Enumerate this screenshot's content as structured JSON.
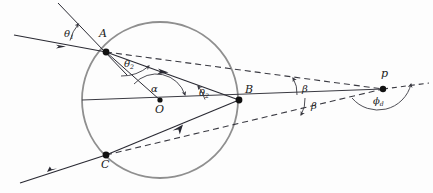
{
  "figure": {
    "type": "optics-ray-diagram",
    "colors": {
      "background": "#fdfdfd",
      "ray": "#2a2a33",
      "circle": "#8a8a8a",
      "dashed": "#3a3a42",
      "point": "#111111",
      "arc": "#3a3a42"
    },
    "canvas": {
      "width": 433,
      "height": 193
    }
  },
  "points": [
    {
      "id": "A",
      "label": "A",
      "x": 106,
      "y": 52,
      "label_x": 99,
      "label_y": 32
    },
    {
      "id": "O",
      "label": "O",
      "x": 160,
      "y": 100,
      "label_x": 155,
      "label_y": 107
    },
    {
      "id": "B",
      "label": "B",
      "x": 239,
      "y": 100,
      "label_x": 243,
      "label_y": 85
    },
    {
      "id": "C",
      "label": "C",
      "x": 106,
      "y": 155,
      "label_x": 100,
      "label_y": 160
    },
    {
      "id": "p",
      "label": "p",
      "x": 383,
      "y": 89,
      "label_x": 381,
      "label_y": 70
    }
  ],
  "circle": {
    "cx": 160,
    "cy": 100,
    "r": 78
  },
  "angles": [
    {
      "id": "theta1",
      "symbol": "θ",
      "subscript": "1",
      "label_x": 66,
      "label_y": 33,
      "vertex": "A",
      "name": "angle-of-incidence"
    },
    {
      "id": "theta2a",
      "symbol": "θ",
      "subscript": "2",
      "label_x": 126,
      "label_y": 63,
      "vertex": "A",
      "name": "angle-of-refraction-at-A"
    },
    {
      "id": "alpha",
      "symbol": "α",
      "subscript": "",
      "label_x": 152,
      "label_y": 88,
      "vertex": "O",
      "name": "central-angle"
    },
    {
      "id": "theta2b",
      "symbol": "θ",
      "subscript": "2",
      "label_x": 200,
      "label_y": 92,
      "vertex": "B",
      "name": "internal-angle-at-B"
    },
    {
      "id": "beta1",
      "symbol": "β",
      "subscript": "",
      "label_x": 303,
      "label_y": 88,
      "vertex": "p",
      "name": "beta-upper"
    },
    {
      "id": "beta2",
      "symbol": "β",
      "subscript": "",
      "label_x": 312,
      "label_y": 104,
      "vertex": "p",
      "name": "beta-lower"
    },
    {
      "id": "phid",
      "symbol": "ϕ",
      "subscript": "d",
      "label_x": 375,
      "label_y": 100,
      "vertex": "p",
      "name": "deviation-angle"
    }
  ],
  "rays": {
    "incident": {
      "name": "incident-ray",
      "from_x": 14,
      "from_y": 35,
      "to_x": 106,
      "to_y": 52
    },
    "normal_at_A": {
      "name": "normal-line-at-A",
      "from_x": 58,
      "from_y": 3,
      "to_x": 127,
      "to_y": 75
    },
    "refracted_AB": {
      "name": "refracted-ray-A-to-B",
      "from_x": 106,
      "from_y": 52,
      "to_x": 239,
      "to_y": 100
    },
    "internal_BC": {
      "name": "internal-ray-B-to-C",
      "from_x": 239,
      "from_y": 100,
      "to_x": 106,
      "to_y": 155
    },
    "exit_C": {
      "name": "exit-ray-from-C",
      "from_x": 106,
      "from_y": 155,
      "to_x": 20,
      "to_y": 183
    },
    "radius_OA": {
      "name": "radius-O-to-A",
      "from_x": 160,
      "from_y": 100,
      "to_x": 106,
      "to_y": 52
    },
    "axis": {
      "name": "optical-axis",
      "from_x": 82,
      "from_y": 100,
      "to_x": 383,
      "to_y": 89
    },
    "dashed_A_to_p": {
      "name": "dashed-extension-A-to-p",
      "from_x": 106,
      "from_y": 52,
      "to_x": 383,
      "to_y": 89
    },
    "dashed_C_to_p": {
      "name": "dashed-extension-C-to-p",
      "from_x": 106,
      "from_y": 155,
      "to_x": 383,
      "to_y": 89
    },
    "dashed_beyond_p": {
      "name": "dashed-ray-beyond-p",
      "from_x": 383,
      "from_y": 89,
      "to_x": 428,
      "to_y": 84
    }
  }
}
